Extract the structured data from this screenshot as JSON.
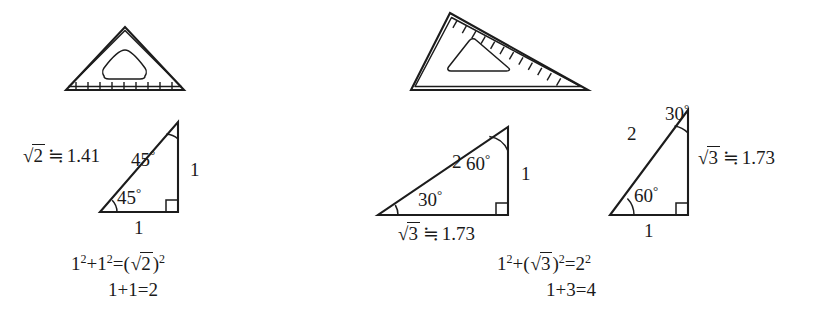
{
  "figure": {
    "background_color": "#ffffff",
    "ink_color": "#1c1c1c"
  },
  "left_panel": {
    "set_square": {
      "name": "45-45-90 set square",
      "tick_count": 10,
      "tick_edge": "bottom"
    },
    "triangle": {
      "type": "45-45-90 right triangle",
      "hypotenuse_label_sqrt": "2",
      "hypotenuse_label_approx": "≒",
      "hypotenuse_label_value": "1.41",
      "angle_top": "45",
      "angle_bottom_left": "45",
      "degree_symbol": "°",
      "side_right_label": "1",
      "side_bottom_label": "1",
      "right_angle_marker": true
    },
    "equations": {
      "line1": {
        "term1": "1",
        "term1_exp": "2",
        "plus": "+",
        "term2": "1",
        "term2_exp": "2",
        "equals": "=",
        "open_paren": "(",
        "radicand": "2",
        "close_paren": ")",
        "result_exp": "2"
      },
      "line2": "1+1=2"
    }
  },
  "right_panel": {
    "set_square": {
      "name": "30-60-90 set square",
      "tick_count": 13,
      "tick_edge": "hypotenuse"
    },
    "triangle_wide": {
      "type": "30-60-90 right triangle (wide orientation)",
      "hypotenuse_label": "2",
      "angle_top_right": "60",
      "angle_bottom_left": "30",
      "degree_symbol": "°",
      "side_right_label": "1",
      "base_label_sqrt": "3",
      "base_label_approx": "≒",
      "base_label_value": "1.73",
      "right_angle_marker": true
    },
    "triangle_tall": {
      "type": "30-60-90 right triangle (tall orientation)",
      "hypotenuse_label": "2",
      "angle_top": "30",
      "angle_bottom_left": "60",
      "degree_symbol": "°",
      "side_right_sqrt": "3",
      "side_right_approx": "≒",
      "side_right_value": "1.73",
      "base_label": "1",
      "right_angle_marker": true
    },
    "equations": {
      "line1": {
        "term1": "1",
        "term1_exp": "2",
        "plus": "+",
        "open_paren": "(",
        "radicand": "3",
        "close_paren": ")",
        "term2_exp": "2",
        "equals": "=",
        "result": "2",
        "result_exp": "2"
      },
      "line2": "1+3=4"
    }
  }
}
